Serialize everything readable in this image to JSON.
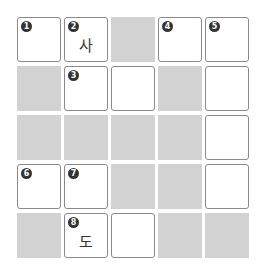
{
  "puzzle": {
    "rows": 5,
    "cols": 5,
    "cells": [
      [
        {
          "type": "white",
          "number": "1",
          "letter": ""
        },
        {
          "type": "white",
          "number": "2",
          "letter": "사"
        },
        {
          "type": "black"
        },
        {
          "type": "white",
          "number": "4",
          "letter": ""
        },
        {
          "type": "white",
          "number": "5",
          "letter": ""
        }
      ],
      [
        {
          "type": "black"
        },
        {
          "type": "white",
          "number": "3",
          "letter": ""
        },
        {
          "type": "white",
          "number": "",
          "letter": ""
        },
        {
          "type": "black"
        },
        {
          "type": "white",
          "number": "",
          "letter": ""
        }
      ],
      [
        {
          "type": "black"
        },
        {
          "type": "black"
        },
        {
          "type": "black"
        },
        {
          "type": "black"
        },
        {
          "type": "white",
          "number": "",
          "letter": ""
        }
      ],
      [
        {
          "type": "white",
          "number": "6",
          "letter": ""
        },
        {
          "type": "white",
          "number": "7",
          "letter": ""
        },
        {
          "type": "black"
        },
        {
          "type": "black"
        },
        {
          "type": "white",
          "number": "",
          "letter": ""
        }
      ],
      [
        {
          "type": "black"
        },
        {
          "type": "white",
          "number": "8",
          "letter": "도"
        },
        {
          "type": "white",
          "number": "",
          "letter": ""
        },
        {
          "type": "black"
        },
        {
          "type": "black"
        }
      ]
    ]
  }
}
